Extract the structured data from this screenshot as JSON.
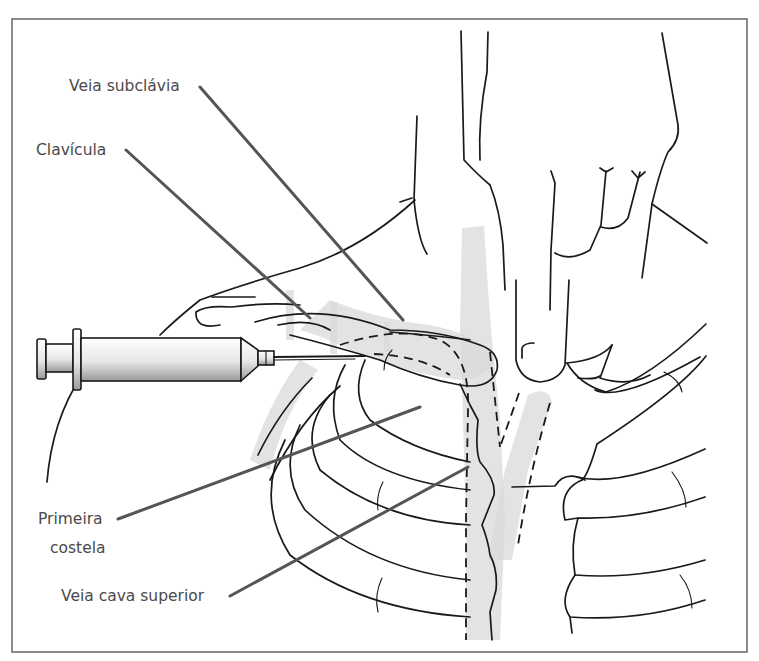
{
  "figure": {
    "type": "anatomical-illustration",
    "labels": {
      "veia_subclavia": "Veia subclávia",
      "clavicula": "Clavícula",
      "primeira_costela_line1": "Primeira",
      "primeira_costela_line2": "costela",
      "veia_cava_superior": "Veia cava superior"
    },
    "colors": {
      "line": "#1a1a1a",
      "leader": "#555555",
      "label_text": "#4a4a4a",
      "frame": "#6e6e6e",
      "shading": "#d9d9d9"
    }
  }
}
